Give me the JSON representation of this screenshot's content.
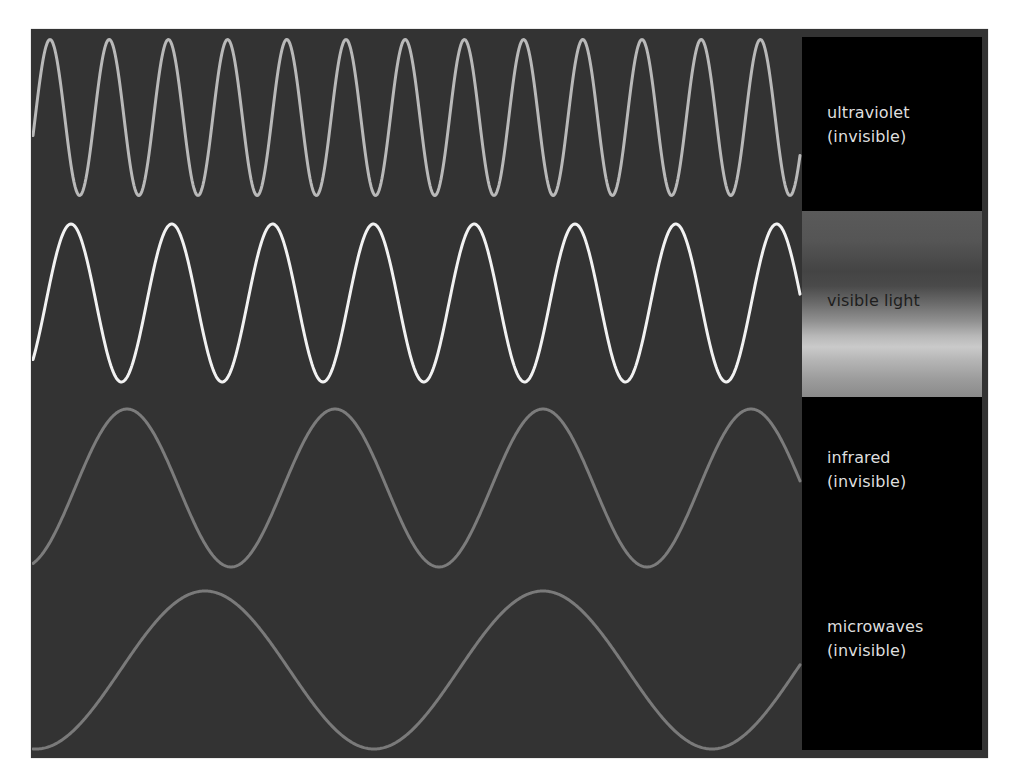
{
  "colors": {
    "page_background": "#ffffff",
    "panel_background": "#333333",
    "label_box_background": "#000000",
    "label_text_light": "#dedede",
    "label_text_dark": "#1e1e1e"
  },
  "waves": [
    {
      "name": "ultraviolet",
      "label_line1": "ultraviolet",
      "label_line2": "(invisible)",
      "color": "#b9b9b9",
      "stroke_width": 3,
      "center_y": 117.5,
      "amplitude": 78,
      "period": 59.2,
      "first_peak_x": 50
    },
    {
      "name": "visible-light",
      "label_line1": "visible light",
      "label_line2": "",
      "color": "#f2f2f2",
      "stroke_width": 3,
      "center_y": 303,
      "amplitude": 79,
      "period": 100.8,
      "first_peak_x": 71
    },
    {
      "name": "infrared",
      "label_line1": "infrared",
      "label_line2": "(invisible)",
      "color": "#7c7c7c",
      "stroke_width": 3,
      "center_y": 488,
      "amplitude": 79,
      "period": 208,
      "first_peak_x": 127
    },
    {
      "name": "microwaves",
      "label_line1": "microwaves",
      "label_line2": "(invisible)",
      "color": "#7a7a7a",
      "stroke_width": 3,
      "center_y": 670,
      "amplitude": 79,
      "period": 338,
      "first_peak_x": 205
    }
  ],
  "wave_x_range": [
    33,
    800
  ],
  "labels": {
    "ultraviolet": {
      "line1": "ultraviolet",
      "line2": "(invisible)"
    },
    "visible": {
      "line1": "visible light"
    },
    "infrared": {
      "line1": "infrared",
      "line2": "(invisible)"
    },
    "microwaves": {
      "line1": "microwaves",
      "line2": "(invisible)"
    }
  }
}
